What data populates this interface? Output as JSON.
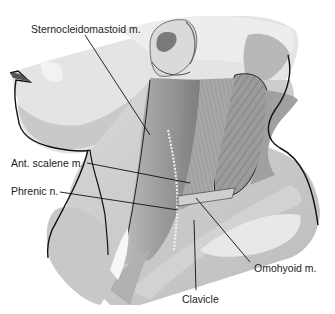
{
  "figure": {
    "labels": [
      {
        "id": "scm",
        "text": "Sternocleidomastoid m."
      },
      {
        "id": "ant_scalene",
        "text": "Ant. scalene m."
      },
      {
        "id": "phrenic",
        "text": "Phrenic n."
      },
      {
        "id": "omohyoid",
        "text": "Omohyoid m."
      },
      {
        "id": "clavicle",
        "text": "Clavicle"
      }
    ]
  },
  "colors": {
    "background": "#ffffff",
    "skin_light": "#e6e6e6",
    "skin_mid": "#cfcfcf",
    "shadow": "#b3b3b3",
    "muscle_dark": "#8a8a8a",
    "muscle_mid": "#a5a5a5",
    "outline": "#1a1a1a",
    "label_text": "#222222"
  }
}
